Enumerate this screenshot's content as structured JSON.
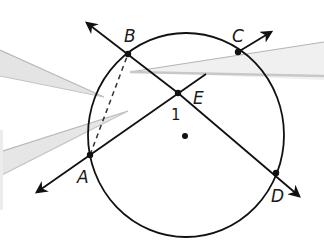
{
  "figure": {
    "type": "circle-geometry",
    "colors": {
      "stroke": "#111111",
      "pointer": "#b8b8b8",
      "background": "#ffffff"
    },
    "circle": {
      "cx": 186,
      "cy": 135,
      "rx": 98,
      "ry": 102
    },
    "center_dot": {
      "x": 185,
      "y": 136
    },
    "points": [
      {
        "name": "A",
        "x": 90,
        "y": 155,
        "label": "A",
        "lx": 77,
        "ly": 183
      },
      {
        "name": "B",
        "x": 128,
        "y": 54,
        "label": "B",
        "lx": 124,
        "ly": 42
      },
      {
        "name": "C",
        "x": 238,
        "y": 52,
        "label": "C",
        "lx": 232,
        "ly": 42
      },
      {
        "name": "D",
        "x": 276,
        "y": 173,
        "label": "D",
        "lx": 271,
        "ly": 200
      },
      {
        "name": "E",
        "x": 178,
        "y": 93,
        "label": "E",
        "lx": 195,
        "ly": 103
      }
    ],
    "angle_label": {
      "text": "1",
      "x": 171,
      "y": 119
    },
    "rays": [
      {
        "from": "E",
        "to": "B",
        "tip": [
          87,
          23
        ]
      },
      {
        "from": "E",
        "to": "D",
        "tip": [
          299,
          196
        ]
      },
      {
        "from": "E",
        "to": "A",
        "tip": [
          37,
          192
        ]
      },
      {
        "from": "B",
        "to": "C",
        "tip": [
          271,
          32
        ]
      }
    ],
    "segment_extension": {
      "from": [
        90,
        155
      ],
      "to": [
        206,
        74
      ]
    },
    "dashed_chord": {
      "from": "A",
      "to": "B"
    }
  }
}
